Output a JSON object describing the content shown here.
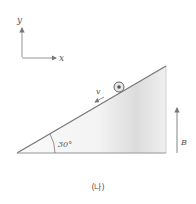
{
  "diagram": {
    "axes": {
      "x_label": "x",
      "y_label": "y"
    },
    "incline": {
      "angle_label": "30°",
      "angle_deg": 30
    },
    "ball": {
      "velocity_label": "v"
    },
    "field": {
      "label": "B",
      "direction": "up"
    },
    "caption": "(나)",
    "colors": {
      "line": "#8a8a8a",
      "fill_light": "#fafafa",
      "fill_dark": "#d9d9d9",
      "text": "#555555"
    }
  }
}
